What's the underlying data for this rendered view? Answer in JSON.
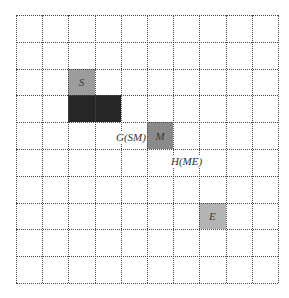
{
  "grid": {
    "cols": 10,
    "rows": 10
  },
  "cells": [
    {
      "id": "S",
      "label": "S",
      "col": 2,
      "row": 2,
      "span": 1,
      "kind": "start",
      "color": "#9c9c9c"
    },
    {
      "id": "obstacle",
      "label": "",
      "col": 2,
      "row": 3,
      "span": 2,
      "kind": "obstacle",
      "color": "#262626"
    },
    {
      "id": "M",
      "label": "M",
      "col": 5,
      "row": 4,
      "span": 1,
      "kind": "mid",
      "color": "#8a8a8a"
    },
    {
      "id": "E",
      "label": "E",
      "col": 7,
      "row": 7,
      "span": 1,
      "kind": "end",
      "color": "#b4b4b4"
    }
  ],
  "annotations": {
    "g_sm": "G(SM)",
    "h_me": "H(ME)"
  },
  "labels": {
    "S": "S",
    "M": "M",
    "E": "E"
  }
}
